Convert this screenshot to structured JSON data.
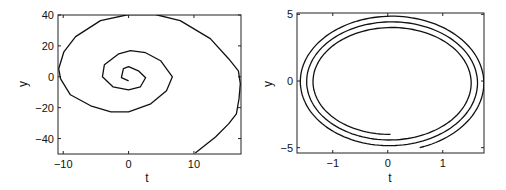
{
  "chart_data": [
    {
      "type": "line",
      "title": "",
      "xlabel": "t",
      "ylabel": "y",
      "xlim": [
        -10.8,
        17.2
      ],
      "ylim": [
        -50,
        40
      ],
      "xticks": [
        -10,
        0,
        10
      ],
      "yticks": [
        40,
        20,
        0,
        -20,
        -40
      ],
      "xtick_labels": [
        "−10",
        "0",
        "10"
      ],
      "ytick_labels": [
        "40",
        "20",
        "0",
        "−20",
        "−40"
      ],
      "grid": false,
      "series": [
        {
          "name": "spiral",
          "x": [
            0.0,
            -1.1,
            -0.8,
            0.0,
            1.5,
            2.6,
            1.8,
            0.0,
            -2.4,
            -4.0,
            -3.7,
            -1.5,
            0.3,
            2.6,
            4.9,
            6.7,
            5.8,
            3.4,
            0.0,
            -2.7,
            -5.8,
            -8.9,
            -10.4,
            -10.7,
            -9.9,
            -8.1,
            -4.3,
            0.0,
            4.1,
            7.9,
            12.5,
            15.3,
            16.8,
            17.1,
            16.9,
            16.5,
            15.3,
            13.3,
            10.2
          ],
          "y": [
            -2.6,
            -0.6,
            5.2,
            6.5,
            3.9,
            -0.6,
            -6.5,
            -8.4,
            -6.5,
            0.0,
            7.8,
            14.9,
            16.9,
            15.6,
            10.4,
            0.0,
            -9.1,
            -17.5,
            -22.7,
            -22.7,
            -18.8,
            -11.7,
            -1.3,
            5.2,
            16.2,
            26.0,
            36.4,
            40.3,
            40.3,
            36.4,
            24.7,
            11.7,
            3.9,
            -4.5,
            -14.3,
            -24.0,
            -30.5,
            -39.0,
            -49.4
          ]
        }
      ]
    },
    {
      "type": "line",
      "title": "",
      "xlabel": "t",
      "ylabel": "y",
      "xlim": [
        -1.65,
        1.75
      ],
      "ylim": [
        -5.4,
        5.1
      ],
      "xticks": [
        -1,
        0,
        1
      ],
      "yticks": [
        5,
        0,
        -5
      ],
      "xtick_labels": [
        "−1",
        "0",
        "1"
      ],
      "ytick_labels": [
        "5",
        "0",
        "−5"
      ],
      "grid": false,
      "series": [
        {
          "name": "spiral",
          "param": {
            "start_angle_deg": -90,
            "turns": 2.95,
            "x_center": 0.05,
            "y_center": -0.1,
            "rx_start": 1.38,
            "rx_end": 1.72,
            "ry_start": 3.9,
            "ry_end": 5.15,
            "start_point": [
              0.0,
              -4.0
            ],
            "end_point": [
              0.25,
              -5.3
            ]
          }
        }
      ]
    }
  ]
}
